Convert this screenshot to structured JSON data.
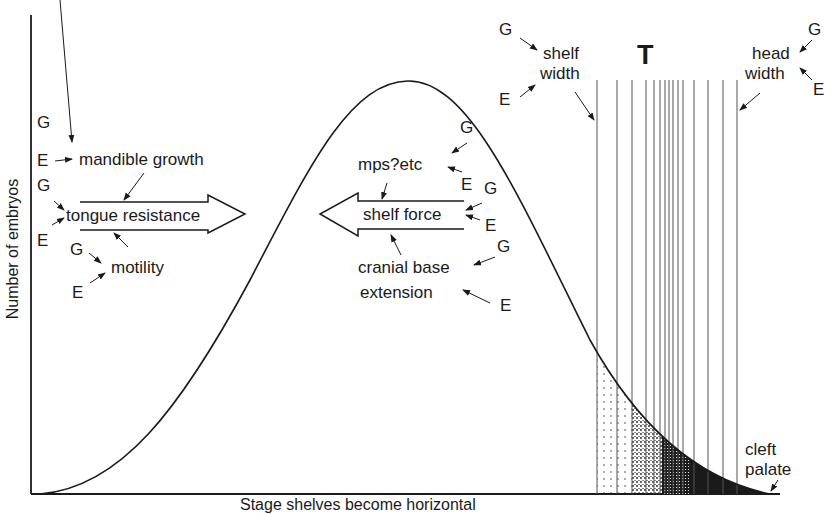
{
  "axes": {
    "y_label": "Number of embryos",
    "x_label": "Stage shelves become horizontal"
  },
  "threshold": {
    "label": "T",
    "line_positions_x": [
      597,
      617,
      632,
      646,
      654,
      660,
      665,
      669,
      673,
      678,
      683,
      694,
      708,
      723,
      737
    ]
  },
  "left_group": {
    "arrow_direction": "right",
    "arrow_label": "tongue resistance",
    "factors": [
      {
        "label": "mandible growth",
        "g": "G",
        "e": "E"
      },
      {
        "label": "tongue resistance",
        "g": "G",
        "e": "E"
      },
      {
        "label": "motility",
        "g": "G",
        "e": "E"
      }
    ]
  },
  "middle_group": {
    "arrow_direction": "left",
    "arrow_label": "shelf force",
    "factors": [
      {
        "label": "mps?etc",
        "g": "G",
        "e": "E"
      },
      {
        "label": "shelf force",
        "g": "G",
        "e": "E"
      },
      {
        "label": "cranial base",
        "label2": "extension",
        "g": "G",
        "e": "E"
      }
    ]
  },
  "top_right": {
    "shelf_width": {
      "line1": "shelf",
      "line2": "width",
      "g": "G",
      "e": "E"
    },
    "head_width": {
      "line1": "head",
      "line2": "width",
      "g": "G",
      "e": "E"
    }
  },
  "outcome": {
    "line1": "cleft",
    "line2": "palate"
  },
  "colors": {
    "ink": "#1a1a1a",
    "background": "#ffffff"
  }
}
